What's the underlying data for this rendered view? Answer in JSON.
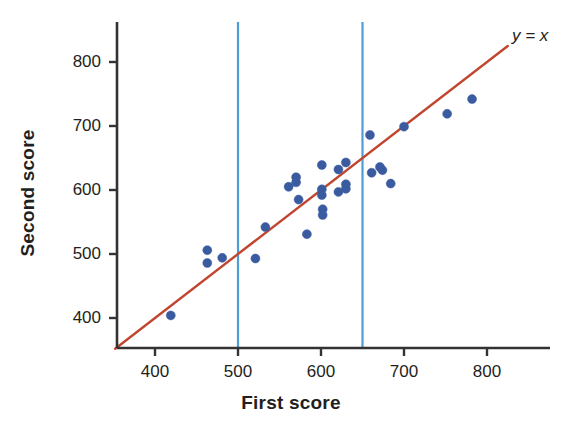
{
  "chart_data": {
    "type": "scatter",
    "title": "",
    "xlabel": "First score",
    "ylabel": "Second score",
    "xlim": [
      350,
      830
    ],
    "ylim": [
      345,
      835
    ],
    "xticks": [
      400,
      500,
      600,
      700,
      800
    ],
    "yticks": [
      400,
      500,
      600,
      700,
      800
    ],
    "xtick_labels": [
      "400",
      "500",
      "600",
      "700",
      "800"
    ],
    "ytick_labels": [
      "400",
      "500",
      "600",
      "700",
      "800"
    ],
    "grid": false,
    "legend": null,
    "annotations": [
      {
        "name": "identity-line-label",
        "text": "y = x",
        "x": 815,
        "y": 825,
        "style": "italic"
      }
    ],
    "reference_line": {
      "name": "identity-line",
      "label": "y = x",
      "equation": "y = x",
      "from": [
        352,
        352
      ],
      "to": [
        825,
        825
      ],
      "color": "#c1462f",
      "width": 2.4
    },
    "vertical_lines": [
      {
        "name": "vline-500",
        "x": 500,
        "color": "#4d9ed6",
        "width": 2.2
      },
      {
        "name": "vline-650",
        "x": 650,
        "color": "#4d9ed6",
        "width": 2.2
      }
    ],
    "marker": {
      "shape": "circle",
      "color": "#3a5ba0",
      "size": 9,
      "edge_color": "#3a5ba0"
    },
    "points": [
      {
        "x": 419,
        "y": 404
      },
      {
        "x": 463,
        "y": 506
      },
      {
        "x": 463,
        "y": 486
      },
      {
        "x": 481,
        "y": 494
      },
      {
        "x": 521,
        "y": 493
      },
      {
        "x": 533,
        "y": 542
      },
      {
        "x": 561,
        "y": 605
      },
      {
        "x": 570,
        "y": 620
      },
      {
        "x": 570,
        "y": 612
      },
      {
        "x": 573,
        "y": 585
      },
      {
        "x": 583,
        "y": 531
      },
      {
        "x": 601,
        "y": 639
      },
      {
        "x": 601,
        "y": 601
      },
      {
        "x": 601,
        "y": 592
      },
      {
        "x": 602,
        "y": 570
      },
      {
        "x": 602,
        "y": 561
      },
      {
        "x": 621,
        "y": 632
      },
      {
        "x": 621,
        "y": 597
      },
      {
        "x": 630,
        "y": 643
      },
      {
        "x": 630,
        "y": 609
      },
      {
        "x": 630,
        "y": 602
      },
      {
        "x": 659,
        "y": 686
      },
      {
        "x": 661,
        "y": 627
      },
      {
        "x": 671,
        "y": 636
      },
      {
        "x": 674,
        "y": 631
      },
      {
        "x": 684,
        "y": 610
      },
      {
        "x": 700,
        "y": 699
      },
      {
        "x": 752,
        "y": 719
      },
      {
        "x": 782,
        "y": 742
      }
    ]
  },
  "axes": {
    "x_title": "First score",
    "y_title": "Second score",
    "axis_color": "#333333"
  }
}
